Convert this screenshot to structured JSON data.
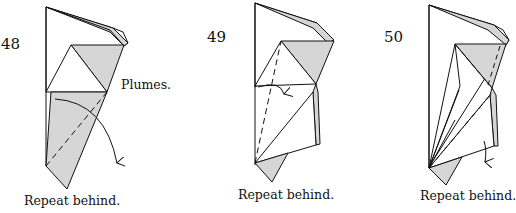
{
  "steps": [
    {
      "number": "48",
      "note": "Plumes.",
      "caption": "Repeat behind."
    },
    {
      "number": "49",
      "caption": "Repeat behind."
    },
    {
      "number": "50",
      "caption": "Repeat behind."
    }
  ],
  "colors": {
    "shade": "#d6d6d6",
    "line": "#111111",
    "paper": "#ffffff"
  }
}
